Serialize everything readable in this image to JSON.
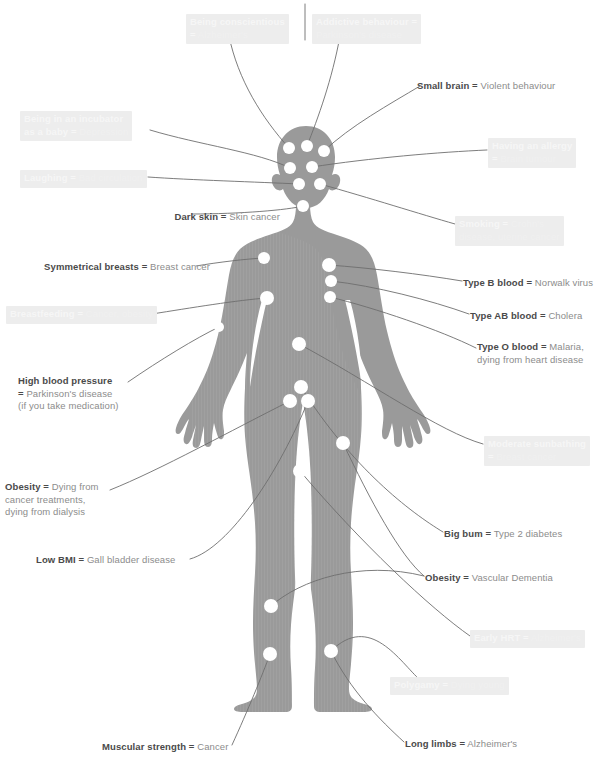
{
  "meta": {
    "figure_fill": "#9a9a9a",
    "dot_fill": "#ffffff",
    "leader_stroke": "#6e6e6e",
    "text_key": "#4a4a4a",
    "text_value": "#8c8c8c",
    "faded_plate": "#ededed",
    "faded_text": "#f1f1f1",
    "background": "#ffffff"
  },
  "top_cut_text": "",
  "labels": [
    {
      "id": "being-conscientious",
      "key": "Being conscientious",
      "eq": "=",
      "value": "Alzheimer's",
      "lines": [
        "Being conscientious",
        "= Alzheimer's"
      ],
      "style": "faded",
      "align": "left",
      "x": 186,
      "y": 14
    },
    {
      "id": "addictive-behaviour",
      "key": "Addictive behaviour",
      "eq": "=",
      "value": "Parkinson's disease",
      "lines": [
        "Addictive behaviour =",
        "Parkinson's disease"
      ],
      "style": "faded",
      "align": "left",
      "x": 312,
      "y": 14
    },
    {
      "id": "small-brain",
      "key": "Small brain",
      "eq": "=",
      "value": "Violent behaviour",
      "lines": [
        "Small brain = Violent behaviour"
      ],
      "style": "normal",
      "align": "left",
      "x": 417,
      "y": 80
    },
    {
      "id": "being-in-an-incubator",
      "key": "Being in an incubator as a baby",
      "eq": "=",
      "value": "Depression",
      "lines": [
        "Being in an incubator",
        "as a baby = Depression"
      ],
      "style": "faded",
      "align": "left",
      "x": 20,
      "y": 111
    },
    {
      "id": "having-an-allergy",
      "key": "Having an allergy",
      "eq": "=",
      "value": "Brain tumour",
      "lines": [
        "Having an allergy",
        "= Brain tumour"
      ],
      "style": "faded",
      "align": "left",
      "x": 488,
      "y": 138
    },
    {
      "id": "laughing",
      "key": "Laughing",
      "eq": "=",
      "value": "Bad circulation",
      "lines": [
        "Laughing = Bad circulation"
      ],
      "style": "faded",
      "align": "left",
      "x": 20,
      "y": 170
    },
    {
      "id": "dark-skin",
      "key": "Dark skin",
      "eq": "=",
      "value": "Skin cancer",
      "lines": [
        "Dark skin = Skin cancer"
      ],
      "style": "normal",
      "align": "right",
      "x": 80,
      "y": 211
    },
    {
      "id": "smoking",
      "key": "Smoking",
      "eq": "=",
      "value": "Crohn's disease, uterine cancer",
      "lines": [
        "Smoking = Crohn's",
        "disease, uterine cancer"
      ],
      "style": "faded",
      "align": "left",
      "x": 455,
      "y": 216
    },
    {
      "id": "symmetrical-breasts",
      "key": "Symmetrical breasts",
      "eq": "=",
      "value": "Breast cancer",
      "lines": [
        "Symmetrical breasts = Breast cancer"
      ],
      "style": "normal",
      "align": "right",
      "x": 10,
      "y": 261
    },
    {
      "id": "type-b-blood",
      "key": "Type B blood",
      "eq": "=",
      "value": "Norwalk virus",
      "lines": [
        "Type B blood = Norwalk virus"
      ],
      "style": "normal",
      "align": "left",
      "x": 463,
      "y": 277
    },
    {
      "id": "breastfeeding",
      "key": "Breastfeeding",
      "eq": "=",
      "value": "Cancer, obesity",
      "lines": [
        "Breastfeeding = Cancer, obesity"
      ],
      "style": "faded",
      "align": "left",
      "x": 6,
      "y": 306
    },
    {
      "id": "type-ab-blood",
      "key": "Type AB blood",
      "eq": "=",
      "value": "Cholera",
      "lines": [
        "Type AB blood = Cholera"
      ],
      "style": "normal",
      "align": "left",
      "x": 470,
      "y": 310
    },
    {
      "id": "type-o-blood",
      "key": "Type O blood",
      "eq": "=",
      "value": "Malaria, dying from heart disease",
      "lines": [
        "Type O blood = Malaria,",
        "dying from heart disease"
      ],
      "style": "normal",
      "align": "left",
      "x": 477,
      "y": 341
    },
    {
      "id": "high-blood-pressure",
      "key": "High blood pressure",
      "eq": "=",
      "value": "Parkinson's disease (if you take medication)",
      "lines": [
        "High blood pressure",
        "= Parkinson's disease",
        "(if you take medication)"
      ],
      "style": "normal",
      "align": "left",
      "x": 18,
      "y": 375
    },
    {
      "id": "moderate-sunbathing",
      "key": "Moderate sunbathing",
      "eq": "=",
      "value": "Breast cancer",
      "lines": [
        "Moderate sunbathing",
        "= Breast cancer"
      ],
      "style": "faded",
      "align": "left",
      "x": 484,
      "y": 436
    },
    {
      "id": "obesity-dialysis",
      "key": "Obesity",
      "eq": "=",
      "value": "Dying from cancer treatments, dying from dialysis",
      "lines": [
        "Obesity = Dying from",
        "cancer treatments,",
        "dying from dialysis"
      ],
      "style": "normal",
      "align": "left",
      "x": 5,
      "y": 481
    },
    {
      "id": "big-bum",
      "key": "Big bum",
      "eq": "=",
      "value": "Type 2 diabetes",
      "lines": [
        "Big bum = Type 2 diabetes"
      ],
      "style": "normal",
      "align": "left",
      "x": 444,
      "y": 528
    },
    {
      "id": "low-bmi",
      "key": "Low BMI",
      "eq": "=",
      "value": "Gall bladder disease",
      "lines": [
        "Low BMI = Gall bladder disease"
      ],
      "style": "normal",
      "align": "left",
      "x": 36,
      "y": 554
    },
    {
      "id": "obesity-vascular-dementia",
      "key": "Obesity",
      "eq": "=",
      "value": "Vascular Dementia",
      "lines": [
        "Obesity = Vascular Dementia"
      ],
      "style": "normal",
      "align": "left",
      "x": 425,
      "y": 572
    },
    {
      "id": "early-hrt",
      "key": "Early HRT",
      "eq": "=",
      "value": "Alzheimer's",
      "lines": [
        "Early HRT = Alzheimer's"
      ],
      "style": "faded",
      "align": "left",
      "x": 470,
      "y": 630
    },
    {
      "id": "polygamy",
      "key": "Polygamy",
      "eq": "=",
      "value": "Dying young",
      "lines": [
        "Polygamy = Dying young"
      ],
      "style": "faded",
      "align": "left",
      "x": 390,
      "y": 677
    },
    {
      "id": "long-limbs",
      "key": "Long limbs",
      "eq": "=",
      "value": "Alzheimer's",
      "lines": [
        "Long limbs = Alzheimer's"
      ],
      "style": "normal",
      "align": "left",
      "x": 405,
      "y": 738
    },
    {
      "id": "muscular-strength",
      "key": "Muscular strength",
      "eq": "=",
      "value": "Cancer",
      "lines": [
        "Muscular strength = Cancer"
      ],
      "style": "normal",
      "align": "left",
      "x": 102,
      "y": 741
    }
  ],
  "dots": [
    {
      "id": "head-1",
      "x": 289,
      "y": 148,
      "r": 6
    },
    {
      "id": "head-2",
      "x": 307,
      "y": 146,
      "r": 6
    },
    {
      "id": "head-3",
      "x": 324,
      "y": 151,
      "r": 6
    },
    {
      "id": "head-4",
      "x": 290,
      "y": 168,
      "r": 6
    },
    {
      "id": "head-5",
      "x": 312,
      "y": 167,
      "r": 6
    },
    {
      "id": "head-6",
      "x": 299,
      "y": 184,
      "r": 6
    },
    {
      "id": "head-7",
      "x": 320,
      "y": 184,
      "r": 6
    },
    {
      "id": "neck-1",
      "x": 303,
      "y": 206,
      "r": 6
    },
    {
      "id": "shoulder-left",
      "x": 264,
      "y": 258,
      "r": 6
    },
    {
      "id": "chest-right-1",
      "x": 329,
      "y": 265,
      "r": 7
    },
    {
      "id": "chest-right-2",
      "x": 331,
      "y": 281,
      "r": 6
    },
    {
      "id": "chest-right-3",
      "x": 330,
      "y": 297,
      "r": 6
    },
    {
      "id": "chest-left-1",
      "x": 267,
      "y": 298,
      "r": 7
    },
    {
      "id": "upper-arm-left",
      "x": 219,
      "y": 327,
      "r": 5
    },
    {
      "id": "abdomen-1",
      "x": 299,
      "y": 344,
      "r": 7
    },
    {
      "id": "pelvis-1",
      "x": 301,
      "y": 387,
      "r": 7
    },
    {
      "id": "pelvis-2",
      "x": 290,
      "y": 401,
      "r": 7
    },
    {
      "id": "pelvis-3",
      "x": 308,
      "y": 401,
      "r": 7
    },
    {
      "id": "hip-right",
      "x": 343,
      "y": 443,
      "r": 7
    },
    {
      "id": "groin-1",
      "x": 300,
      "y": 471,
      "r": 7
    },
    {
      "id": "knee-left",
      "x": 271,
      "y": 606,
      "r": 7
    },
    {
      "id": "shin-left",
      "x": 270,
      "y": 654,
      "r": 7
    },
    {
      "id": "shin-right",
      "x": 331,
      "y": 651,
      "r": 7
    }
  ]
}
